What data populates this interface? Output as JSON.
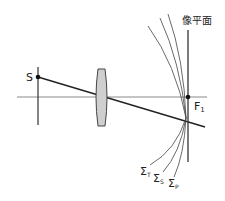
{
  "diagram": {
    "type": "optics-field-curvature",
    "labels": {
      "source": "S",
      "focal_point": "F",
      "focal_point_sub": "1",
      "image_plane": "像平面",
      "sigma": "Σ",
      "sigma_t_sub": "T",
      "sigma_s_sub": "S",
      "sigma_p_sub": "P"
    },
    "colors": {
      "line": "#333333",
      "axis": "#8a8a8a",
      "lens_fill": "#cfcfcf",
      "curve": "#444444"
    }
  }
}
